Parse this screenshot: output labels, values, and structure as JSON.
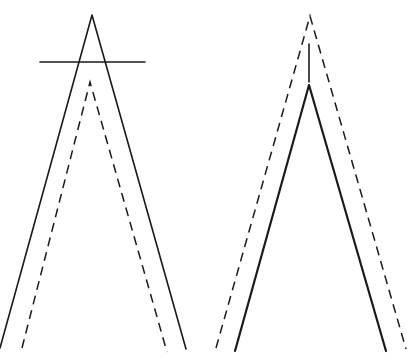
{
  "canvas": {
    "width": 407,
    "height": 363,
    "background": "#ffffff",
    "stroke_color": "#1a1a1a"
  },
  "figures": [
    {
      "name": "left-figure",
      "solid_wedge": {
        "apex": [
          92,
          15
        ],
        "left_end": [
          0,
          348
        ],
        "right_end": [
          186,
          349
        ]
      },
      "crossbar": {
        "from": [
          40,
          62
        ],
        "to": [
          145,
          62
        ]
      },
      "dashed_wedge": {
        "apex": [
          90,
          82
        ],
        "left_end": [
          22,
          348
        ],
        "right_end": [
          167,
          352
        ]
      }
    },
    {
      "name": "right-figure",
      "dashed_wedge": {
        "apex": [
          310,
          16
        ],
        "left_end": [
          216,
          348
        ],
        "right_end": [
          406,
          349
        ]
      },
      "stem": {
        "from": [
          309,
          44
        ],
        "to": [
          309,
          82
        ]
      },
      "solid_wedge": {
        "apex": [
          309,
          85
        ],
        "left_end": [
          235,
          351
        ],
        "right_end": [
          386,
          351
        ]
      }
    }
  ]
}
